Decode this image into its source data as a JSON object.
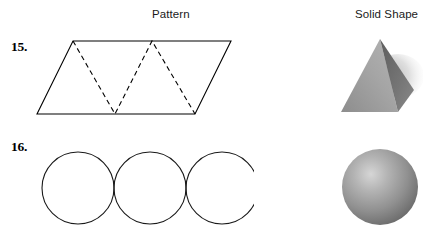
{
  "page": {
    "background": "#ffffff",
    "ink": "#000000",
    "width": 423,
    "height": 225
  },
  "headings": {
    "pattern": "Pattern",
    "solid_shape": "Solid Shape"
  },
  "problems": [
    {
      "number": "15.",
      "pattern": {
        "name": "parallelogram-with-dashed-fold-lines",
        "description": "Parallelogram net divided by dashed zigzag fold lines into four triangles",
        "outline_color": "#000000",
        "fold_line_color": "#000000",
        "fold_line_style": "dashed",
        "triangle_count": 4
      },
      "solid_shape": {
        "name": "pyramid",
        "label": "Pyramid",
        "shading": "gray gradient, light left face, dark right face, soft drop shadow to the right",
        "light_face_color": "#a9a9a9",
        "dark_face_color": "#6e6e6e",
        "shadow_color": "#b9b9b9"
      }
    },
    {
      "number": "16.",
      "pattern": {
        "name": "three-tangent-circles",
        "description": "Three equal circles in a horizontal row, each tangent to the next, bottoms cropped by the page edge",
        "outline_color": "#1a1a1a",
        "circle_count": 3,
        "circle_diameter": 72
      },
      "solid_shape": {
        "name": "sphere",
        "label": "Sphere",
        "shading": "gray radial gradient with highlight at upper-left",
        "highlight_color": "#d2d2d2",
        "mid_color": "#8f8f8f",
        "edge_color": "#5c5c5c"
      }
    }
  ]
}
